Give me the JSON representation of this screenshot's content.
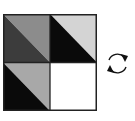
{
  "diagram": {
    "grid": {
      "rows": 2,
      "cols": 2,
      "border_color": "#222222",
      "cells": [
        {
          "position": "top-left",
          "diagonal": "top-left to bottom-right",
          "upper_triangle_color": "#8c8c8c",
          "lower_triangle_color": "#3c3c3c"
        },
        {
          "position": "top-right",
          "diagonal": "top-left to bottom-right",
          "upper_triangle_color": "#d4d4d4",
          "lower_triangle_color": "#0a0a0a"
        },
        {
          "position": "bottom-left",
          "diagonal": "top-left to bottom-right",
          "upper_triangle_color": "#a8a8a8",
          "lower_triangle_color": "#0a0a0a"
        },
        {
          "position": "bottom-right",
          "diagonal": "none",
          "fill_color": "#ffffff"
        }
      ]
    },
    "icon": {
      "name": "rotate-clockwise-icon",
      "color": "#111111"
    }
  }
}
